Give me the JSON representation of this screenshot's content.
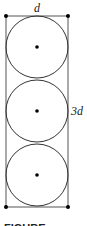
{
  "diagram": {
    "width_label": "d",
    "height_label": "3d",
    "caption_partial": "FIGURE",
    "circle_count": 3,
    "colors": {
      "stroke": "#333333",
      "dot": "#000000",
      "background": "#ffffff"
    }
  }
}
